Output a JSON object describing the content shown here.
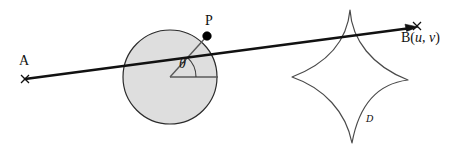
{
  "figure": {
    "background_color": "#ffffff",
    "width": 459,
    "height": 152,
    "labels": {
      "point_a": "A",
      "point_p": "P",
      "angle_theta": "θ",
      "point_b_name": "B",
      "point_b_coords_open": "(",
      "point_b_coord_u": "u",
      "point_b_coord_sep": ", ",
      "point_b_coord_v": "v",
      "point_b_coords_close": ")",
      "region_d": "ᴰ"
    },
    "colors": {
      "stroke": "#111111",
      "circle_fill": "#dedede",
      "circle_stroke": "#2b2b2b",
      "radius_stroke": "#555555",
      "astroid_stroke": "#4a4a4a",
      "point_marker": "#000000"
    },
    "geometry": {
      "circle": {
        "cx": 170,
        "cy": 77,
        "r": 47
      },
      "point_a": {
        "x": 25,
        "y": 79
      },
      "point_p": {
        "x": 207,
        "y": 36
      },
      "point_b": {
        "x": 417,
        "y": 27
      },
      "radius_horizontal_end": {
        "x": 218,
        "y": 77
      },
      "angle_arc_radius": 26,
      "astroid_cusps": {
        "top": {
          "x": 350,
          "y": 10
        },
        "left": {
          "x": 292,
          "y": 77
        },
        "right": {
          "x": 408,
          "y": 80
        },
        "bottom": {
          "x": 352,
          "y": 143
        }
      }
    }
  }
}
